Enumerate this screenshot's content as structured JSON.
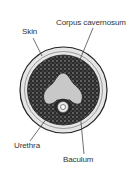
{
  "diagram": {
    "type": "cross-section",
    "labels": {
      "skin": "Skin",
      "corpus_cavernosum": "Corpus cavernosum",
      "urethra": "Urethra",
      "baculum": "Baculum"
    },
    "colors": {
      "background": "#ffffff",
      "outline": "#222222",
      "tissue_dark": "#2a2a2a",
      "baculum_fill": "#c8c8c8",
      "skin_fill": "#e6e6e6"
    }
  }
}
